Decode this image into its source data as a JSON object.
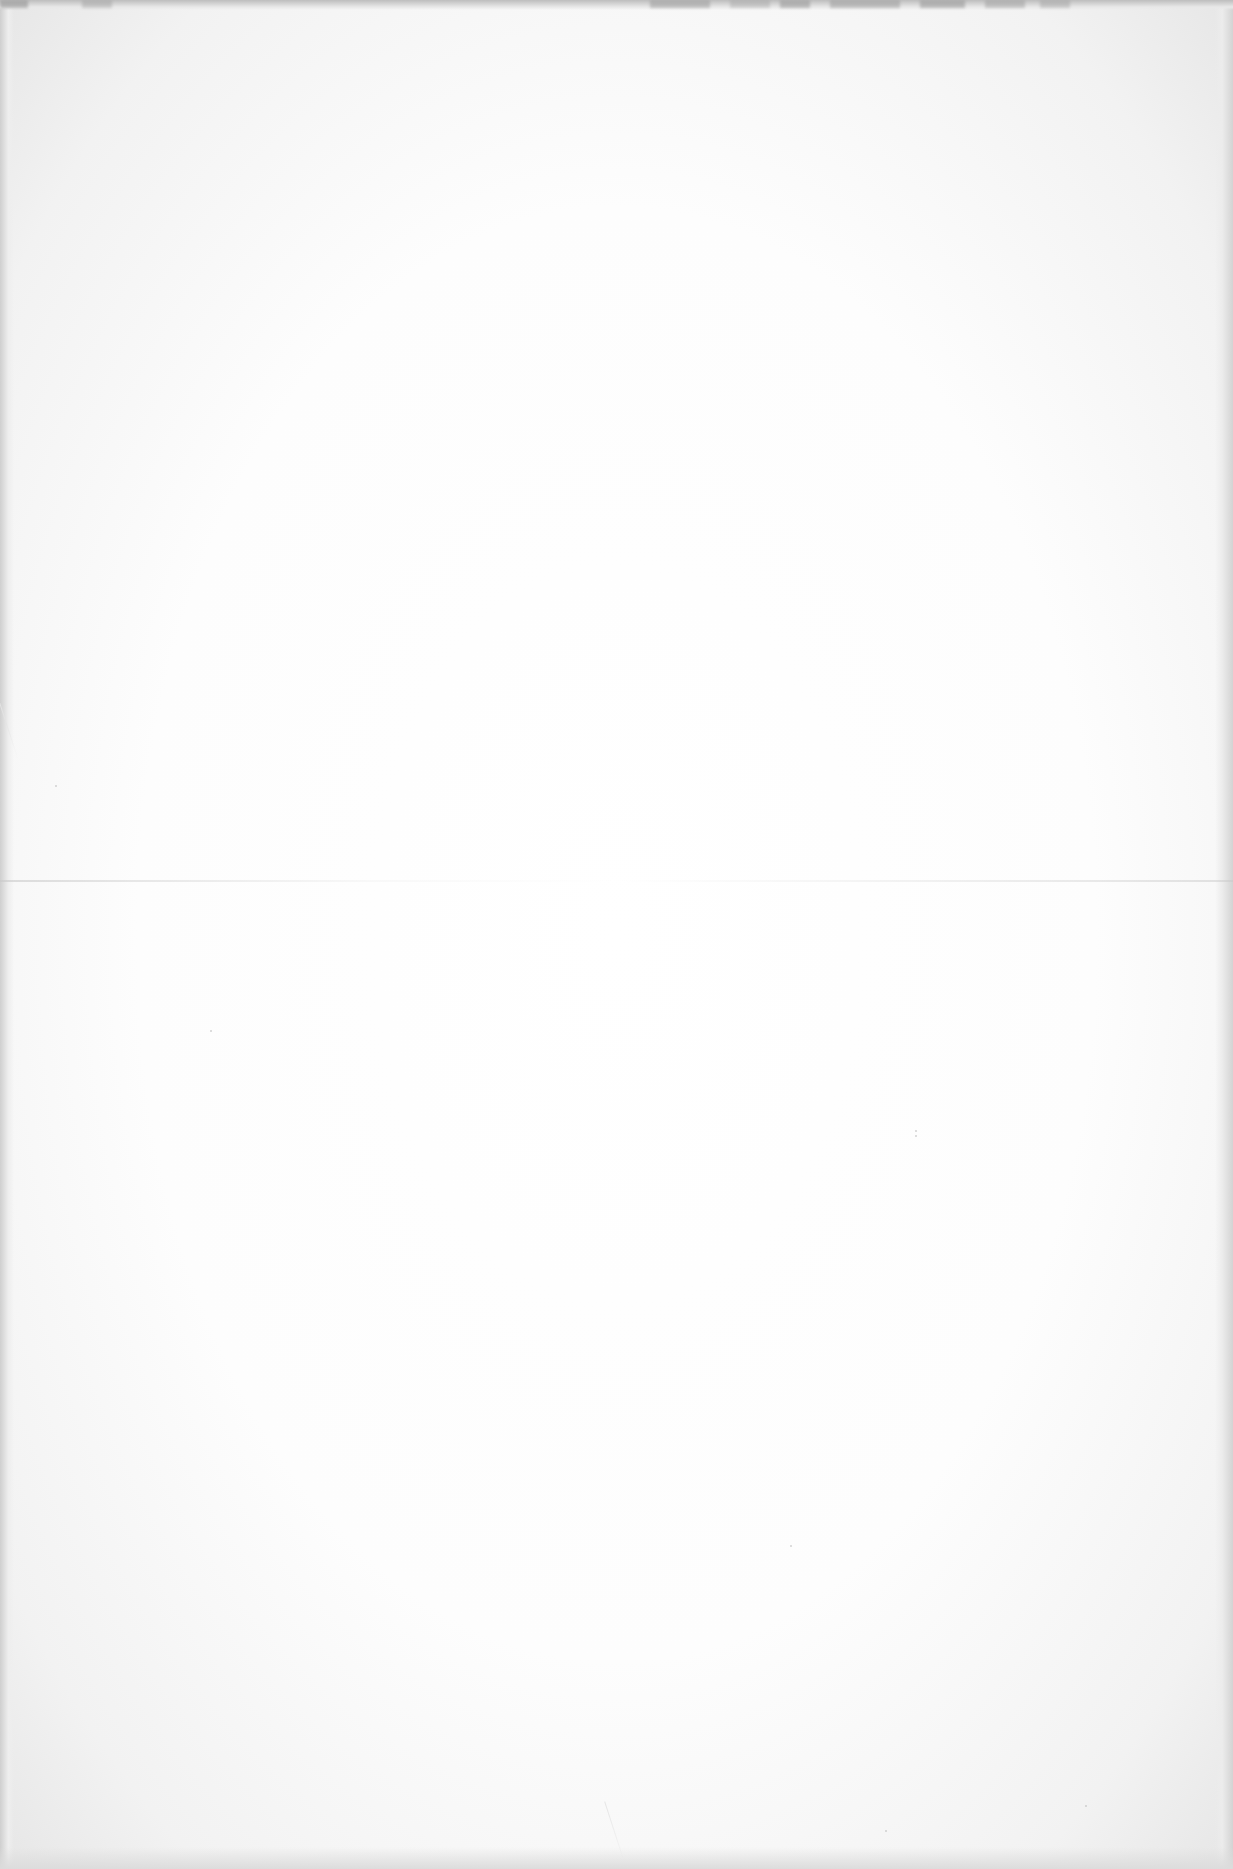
{
  "document": {
    "page_type": "blank scanned page",
    "text_content": "",
    "status": "No legible content"
  }
}
